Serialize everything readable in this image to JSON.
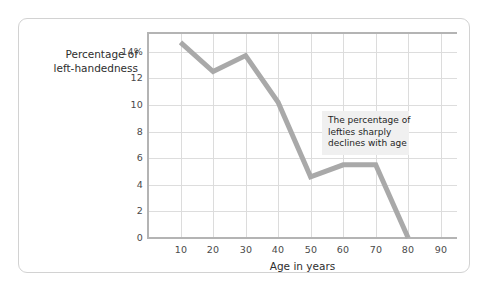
{
  "figure": {
    "frame_color": "#d2d2d2",
    "background": "#ffffff"
  },
  "axes": {
    "ylabel_line1": "Percentage of",
    "ylabel_line2": "left-handedness",
    "xlabel": "Age in years",
    "ytick_labels": [
      "14%",
      "12",
      "10",
      "8",
      "6",
      "4",
      "2",
      "0"
    ],
    "xtick_labels": [
      "10",
      "20",
      "30",
      "40",
      "50",
      "60",
      "70",
      "80",
      "90"
    ]
  },
  "annotation": {
    "line1": "The percentage of",
    "line2": "lefties sharply",
    "line3": "declines with age"
  },
  "chart_data": {
    "type": "line",
    "title": "",
    "xlabel": "Age in years",
    "ylabel": "Percentage of left-handedness",
    "x": [
      10,
      20,
      30,
      40,
      50,
      60,
      70,
      80
    ],
    "values": [
      14.7,
      12.5,
      13.7,
      10.2,
      4.6,
      5.5,
      5.5,
      0
    ],
    "xlim": [
      0,
      95
    ],
    "ylim": [
      0,
      15.4
    ],
    "xticks": [
      10,
      20,
      30,
      40,
      50,
      60,
      70,
      80,
      90
    ],
    "yticks": [
      0,
      2,
      4,
      6,
      8,
      10,
      12,
      14
    ],
    "ytick_labels": [
      "0",
      "2",
      "4",
      "6",
      "8",
      "10",
      "12",
      "14%"
    ],
    "grid": true,
    "legend": "none",
    "series": [
      {
        "name": "Percentage of left-handedness",
        "color": "#a9a9a9",
        "line_width": 5,
        "values": [
          14.7,
          12.5,
          13.7,
          10.2,
          4.6,
          5.5,
          5.5,
          0
        ]
      }
    ],
    "annotations": [
      {
        "text": "The percentage of lefties sharply declines with age",
        "x": 62,
        "y": 9.2,
        "background": "#f0f0f0"
      }
    ]
  }
}
